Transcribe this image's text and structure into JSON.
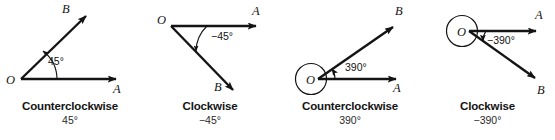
{
  "figure": {
    "background": "#ffffff",
    "stroke_color": "#141414"
  },
  "panels": [
    {
      "id": "panel-1",
      "caption_title": "Counterclockwise",
      "caption_value": "45°",
      "vertex_label": "O",
      "initial_ray_label": "A",
      "terminal_ray_label": "B",
      "angle_label": "45°",
      "angle_degrees": 45,
      "direction": "counterclockwise",
      "revolution_loop": false
    },
    {
      "id": "panel-2",
      "caption_title": "Clockwise",
      "caption_value": "−45°",
      "vertex_label": "O",
      "initial_ray_label": "A",
      "terminal_ray_label": "B",
      "angle_label": "−45°",
      "angle_degrees": -45,
      "direction": "clockwise",
      "revolution_loop": false
    },
    {
      "id": "panel-3",
      "caption_title": "Counterclockwise",
      "caption_value": "390°",
      "vertex_label": "O",
      "initial_ray_label": "A",
      "terminal_ray_label": "B",
      "angle_label": "390°",
      "angle_degrees": 390,
      "direction": "counterclockwise",
      "revolution_loop": true
    },
    {
      "id": "panel-4",
      "caption_title": "Clockwise",
      "caption_value": "−390°",
      "vertex_label": "O",
      "initial_ray_label": "A",
      "terminal_ray_label": "B",
      "angle_label": "−390°",
      "angle_degrees": -390,
      "direction": "clockwise",
      "revolution_loop": true
    }
  ]
}
